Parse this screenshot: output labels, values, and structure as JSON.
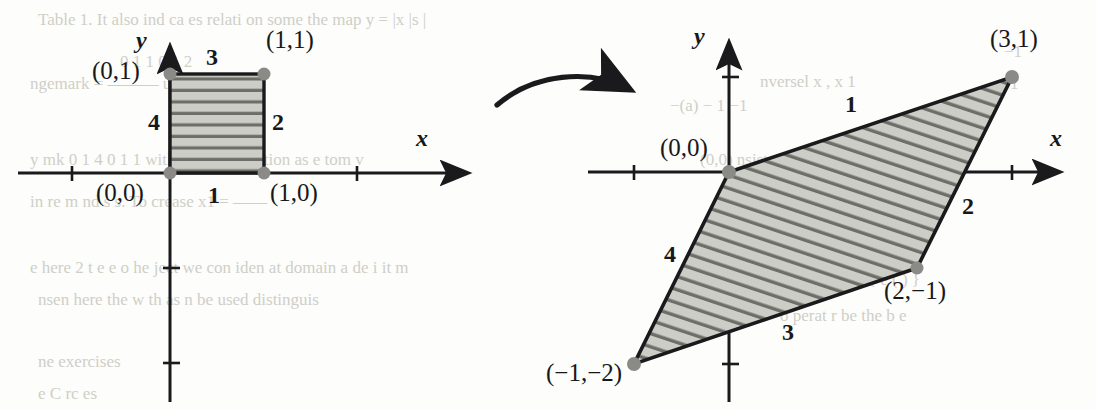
{
  "figure": {
    "colors": {
      "stroke": "#1a1a1c",
      "fill": "#c9c9c4",
      "hatch": "#6e6e68",
      "vertex": "#8a8a86",
      "axis": "#1a1a1c",
      "page": "#fdfdfb",
      "bleed_text": "#cfcfc8"
    },
    "panels": [
      {
        "id": "domain",
        "name": "unit-square-panel",
        "axis_labels": {
          "x": "x",
          "y": "y"
        },
        "shape": "square",
        "vertex_labels": [
          {
            "text": "(0,1)",
            "vertex": [
              0,
              1
            ]
          },
          {
            "text": "(1,1)",
            "vertex": [
              1,
              1
            ]
          },
          {
            "text": "(0,0)",
            "vertex": [
              0,
              0
            ]
          },
          {
            "text": "(1,0)",
            "vertex": [
              1,
              0
            ]
          }
        ],
        "edge_labels": [
          {
            "text": "1",
            "edge": "bottom"
          },
          {
            "text": "2",
            "edge": "right"
          },
          {
            "text": "3",
            "edge": "top"
          },
          {
            "text": "4",
            "edge": "left"
          }
        ]
      },
      {
        "id": "image",
        "name": "parallelogram-panel",
        "axis_labels": {
          "x": "x",
          "y": "y"
        },
        "shape": "parallelogram",
        "vertex_labels": [
          {
            "text": "(0,0)",
            "vertex": [
              0,
              0
            ]
          },
          {
            "text": "(3,1)",
            "vertex": [
              3,
              1
            ]
          },
          {
            "text": "(2,−1)",
            "vertex": [
              2,
              -1
            ]
          },
          {
            "text": "(−1,−2)",
            "vertex": [
              -1,
              -2
            ]
          }
        ],
        "edge_labels": [
          {
            "text": "1",
            "edge": "top"
          },
          {
            "text": "2",
            "edge": "right"
          },
          {
            "text": "3",
            "edge": "bottom"
          },
          {
            "text": "4",
            "edge": "left"
          }
        ]
      }
    ],
    "arrow": {
      "name": "transformation-arrow",
      "label": ""
    },
    "bleed_text": [
      {
        "text": "Table 1. It also ind ca es   relati on some   the map  y =  |x |s |",
        "x": 38,
        "y": 10
      },
      {
        "text": "0   1     1   0      1   2",
        "x": 120,
        "y": 52
      },
      {
        "text": "ngemark  =   ———  u maps  onto",
        "x": 30,
        "y": 74
      },
      {
        "text": "y  mk  0 1   4 0  1 1  with ass  men  relation  as   e  tom v",
        "x": 30,
        "y": 150
      },
      {
        "text": "in  re m   nd   s  s.  To  crease   x1 =  ——",
        "x": 30,
        "y": 192
      },
      {
        "text": "e  here  2 t e  e  o  he   ject  we  con iden   at   domain  a  de i  it m",
        "x": 30,
        "y": 258
      },
      {
        "text": "nsen  here the  w    th   as   n   be  used  distinguis",
        "x": 38,
        "y": 290
      },
      {
        "text": "ne  exercises",
        "x": 38,
        "y": 352
      },
      {
        "text": "−1",
        "x": 1004,
        "y": 42
      },
      {
        "text": "1",
        "x": 1010,
        "y": 74
      },
      {
        "text": "nversel  x ,  x 1",
        "x": 760,
        "y": 72
      },
      {
        "text": "−(a)  −   1   −1",
        "x": 670,
        "y": 96
      },
      {
        "text": "(0,0)   nsists  (1,1)",
        "x": 700,
        "y": 150
      },
      {
        "text": "nce   {  e  (  ) }",
        "x": 840,
        "y": 270
      },
      {
        "text": "o perat  r  be  the  b e",
        "x": 780,
        "y": 306
      },
      {
        "text": "e C rc es",
        "x": 38,
        "y": 384
      }
    ]
  },
  "chart_data": {
    "type": "scatter",
    "panels": [
      {
        "name": "unit square (domain)",
        "xlabel": "x",
        "ylabel": "y",
        "xlim": [
          -0.35,
          3.0
        ],
        "ylim": [
          -2.1,
          1.5
        ],
        "grid": false,
        "xticks": [
          1,
          2
        ],
        "yticks": [
          -1,
          -2
        ],
        "polygon": {
          "label": "unit square",
          "vertices": [
            [
              0,
              0
            ],
            [
              1,
              0
            ],
            [
              1,
              1
            ],
            [
              0,
              1
            ]
          ],
          "closed": true,
          "fill": "#c9c9c4",
          "hatch": "horizontal"
        },
        "points": [
          {
            "x": 0,
            "y": 0,
            "label": "(0,0)"
          },
          {
            "x": 1,
            "y": 0,
            "label": "(1,0)"
          },
          {
            "x": 1,
            "y": 1,
            "label": "(1,1)"
          },
          {
            "x": 0,
            "y": 1,
            "label": "(0,1)"
          }
        ],
        "edge_annotations": [
          {
            "text": "1",
            "from": [
              0,
              0
            ],
            "to": [
              1,
              0
            ]
          },
          {
            "text": "2",
            "from": [
              1,
              0
            ],
            "to": [
              1,
              1
            ]
          },
          {
            "text": "3",
            "from": [
              1,
              1
            ],
            "to": [
              0,
              1
            ]
          },
          {
            "text": "4",
            "from": [
              0,
              1
            ],
            "to": [
              0,
              0
            ]
          }
        ]
      },
      {
        "name": "parallelogram (image)",
        "xlabel": "x",
        "ylabel": "y",
        "xlim": [
          -1.3,
          3.3
        ],
        "ylim": [
          -2.3,
          1.4
        ],
        "grid": false,
        "xticks": [
          -1,
          1,
          2,
          3
        ],
        "yticks": [
          1,
          -1,
          -2
        ],
        "polygon": {
          "label": "image parallelogram",
          "vertices": [
            [
              0,
              0
            ],
            [
              3,
              1
            ],
            [
              2,
              -1
            ],
            [
              -1,
              -2
            ]
          ],
          "closed": true,
          "fill": "#c9c9c4",
          "hatch": "diagonal-slope-1-over-3"
        },
        "points": [
          {
            "x": 0,
            "y": 0,
            "label": "(0,0)"
          },
          {
            "x": 3,
            "y": 1,
            "label": "(3,1)"
          },
          {
            "x": 2,
            "y": -1,
            "label": "(2,−1)"
          },
          {
            "x": -1,
            "y": -2,
            "label": "(−1,−2)"
          }
        ],
        "edge_annotations": [
          {
            "text": "1",
            "from": [
              0,
              0
            ],
            "to": [
              3,
              1
            ]
          },
          {
            "text": "2",
            "from": [
              3,
              1
            ],
            "to": [
              2,
              -1
            ]
          },
          {
            "text": "3",
            "from": [
              2,
              -1
            ],
            "to": [
              -1,
              -2
            ]
          },
          {
            "text": "4",
            "from": [
              -1,
              -2
            ],
            "to": [
              0,
              0
            ]
          }
        ]
      }
    ]
  }
}
